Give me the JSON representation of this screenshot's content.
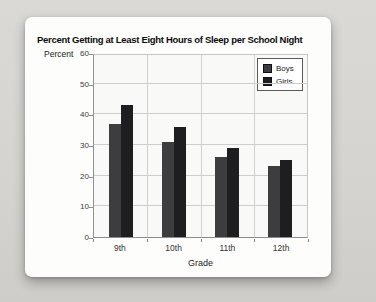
{
  "chart": {
    "title": "Percent Getting at Least Eight Hours of Sleep per School Night",
    "y_axis_title": "Percent",
    "x_axis_title": "Grade"
  },
  "chart_data": {
    "type": "bar",
    "title": "Percent Getting at Least Eight Hours of Sleep per School Night",
    "xlabel": "Grade",
    "ylabel": "Percent",
    "categories": [
      "9th",
      "10th",
      "11th",
      "12th"
    ],
    "series": [
      {
        "name": "Boys",
        "color": "#3d3d3f",
        "values": [
          37,
          31,
          26,
          23
        ]
      },
      {
        "name": "Girls",
        "color": "#1e1e20",
        "values": [
          43,
          36,
          29,
          25
        ]
      }
    ],
    "ylim": [
      0,
      60
    ],
    "ytick_step": 10,
    "yticks": [
      0,
      10,
      20,
      30,
      40,
      50,
      60
    ],
    "grid": true,
    "legend_position": "top-right",
    "legend_entries": [
      "Boys",
      "Girls"
    ]
  },
  "colors": {
    "page_background": "#d6d4d0",
    "card_background": "#fdfdfb",
    "gridline": "#cdcdcb",
    "boys_bar": "#3d3d3f",
    "girls_bar": "#1e1e20"
  }
}
